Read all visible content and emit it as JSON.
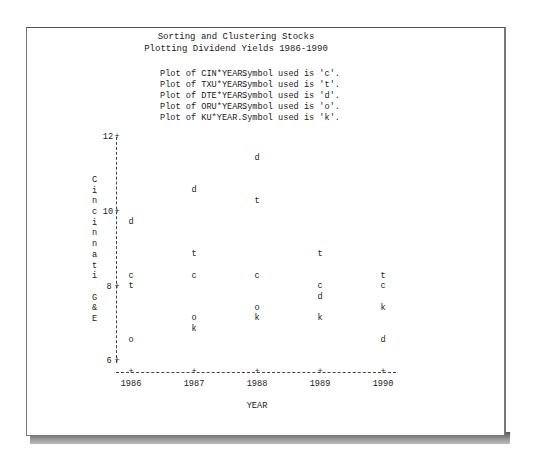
{
  "page": {
    "title_line1": "Sorting and Clustering Stocks",
    "title_line2": "Plotting Dividend Yields 1986-1990",
    "legend": [
      {
        "plot": "Plot of CIN*YEAR.",
        "symbol_text": "Symbol used is 'c'."
      },
      {
        "plot": "Plot of TXU*YEAR.",
        "symbol_text": "Symbol used is 't'."
      },
      {
        "plot": "Plot of DTE*YEAR.",
        "symbol_text": "Symbol used is 'd'."
      },
      {
        "plot": "Plot of ORU*YEAR.",
        "symbol_text": "Symbol used is 'o'."
      },
      {
        "plot": "Plot of KU*YEAR.",
        "symbol_text": "Symbol used is 'k'."
      }
    ],
    "y_axis_label_letters": [
      "C",
      "i",
      "n",
      "c",
      "i",
      "n",
      "n",
      "a",
      "t",
      "i",
      "",
      "G",
      "&",
      "E"
    ],
    "y_ticks": [
      "12",
      "10",
      "8",
      "6"
    ],
    "x_ticks": [
      "1986",
      "1987",
      "1988",
      "1989",
      "1990"
    ],
    "x_label": "YEAR"
  },
  "chart_data": {
    "type": "scatter",
    "title": "Sorting and Clustering Stocks",
    "subtitle": "Plotting Dividend Yields 1986-1990",
    "xlabel": "YEAR",
    "ylabel": "Cincinnati G&E",
    "x": [
      1986,
      1987,
      1988,
      1989,
      1990
    ],
    "xlim": [
      1986,
      1990
    ],
    "ylim": [
      6,
      12
    ],
    "y_ticks": [
      6,
      8,
      10,
      12
    ],
    "grid": false,
    "legend_position": "top",
    "series": [
      {
        "name": "CIN",
        "symbol": "c",
        "values": [
          8.29,
          8.29,
          8.29,
          8.0,
          8.0
        ]
      },
      {
        "name": "TXU",
        "symbol": "t",
        "values": [
          8.0,
          8.86,
          10.29,
          8.86,
          8.29
        ]
      },
      {
        "name": "DTE",
        "symbol": "d",
        "values": [
          9.71,
          10.57,
          11.43,
          7.71,
          6.57
        ]
      },
      {
        "name": "ORU",
        "symbol": "o",
        "values": [
          6.57,
          7.14,
          7.43,
          null,
          null
        ]
      },
      {
        "name": "KU",
        "symbol": "k",
        "values": [
          null,
          6.86,
          7.14,
          7.14,
          7.43
        ]
      }
    ]
  }
}
